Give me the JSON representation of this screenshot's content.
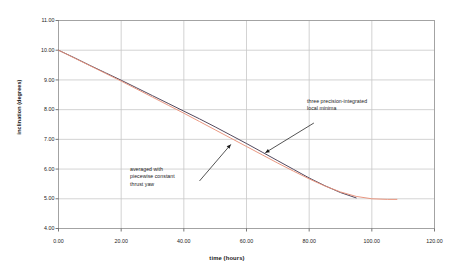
{
  "chart_data": {
    "type": "line",
    "title": "",
    "subtitle": "",
    "xlabel": "time (hours)",
    "ylabel": "inclination (degrees)",
    "xlim": [
      0,
      120
    ],
    "ylim": [
      4,
      11
    ],
    "xticks": [
      "0.00",
      "20.00",
      "40.00",
      "60.00",
      "80.00",
      "100.00",
      "120.00"
    ],
    "xtick_values": [
      0,
      20,
      40,
      60,
      80,
      100,
      120
    ],
    "yticks": [
      "4.00",
      "5.00",
      "6.00",
      "7.00",
      "8.00",
      "9.00",
      "10.00",
      "11.00"
    ],
    "ytick_values": [
      4,
      5,
      6,
      7,
      8,
      9,
      10,
      11
    ],
    "grid": true,
    "legend_position": "none",
    "series": [
      {
        "name": "three precision-integrated local minima",
        "color": "#4a3f55",
        "x": [
          0,
          5,
          10,
          15,
          20,
          25,
          30,
          35,
          40,
          45,
          50,
          55,
          60,
          65,
          70,
          75,
          80,
          85,
          90,
          95
        ],
        "values": [
          10.0,
          9.75,
          9.49,
          9.24,
          8.99,
          8.73,
          8.47,
          8.21,
          7.95,
          7.69,
          7.42,
          7.14,
          6.86,
          6.57,
          6.28,
          5.99,
          5.7,
          5.44,
          5.21,
          5.03
        ]
      },
      {
        "name": "averaged with piecewise constant thrust yaw",
        "color": "#e8917a",
        "x": [
          0,
          5,
          10,
          15,
          20,
          25,
          30,
          35,
          40,
          45,
          50,
          55,
          60,
          65,
          70,
          75,
          80,
          85,
          90,
          95,
          100,
          105,
          108
        ],
        "values": [
          10.0,
          9.74,
          9.48,
          9.22,
          8.96,
          8.69,
          8.42,
          8.15,
          7.88,
          7.6,
          7.32,
          7.04,
          6.76,
          6.48,
          6.2,
          5.93,
          5.67,
          5.43,
          5.23,
          5.08,
          5.0,
          4.98,
          4.98
        ]
      }
    ],
    "annotations": [
      {
        "id": "minima",
        "lines": [
          "three precision-integrated",
          "local minima"
        ],
        "text": "three precision-integrated local minima",
        "arrow_from": [
          81.5,
          7.55
        ],
        "arrow_to": [
          66.0,
          6.55
        ]
      },
      {
        "id": "averaged",
        "lines": [
          "averaged with",
          "piecewise constant",
          "thrust yaw"
        ],
        "text": "averaged with piecewise constant thrust yaw",
        "arrow_from": [
          45.0,
          5.6
        ],
        "arrow_to": [
          55.0,
          6.83
        ]
      }
    ]
  },
  "colors": {
    "background": "#ffffff",
    "frame": "#9a9a9a",
    "grid": "#c8c8c8",
    "series_dark": "#4a3f55",
    "series_salmon": "#e8917a",
    "text": "#1b1b1b"
  }
}
